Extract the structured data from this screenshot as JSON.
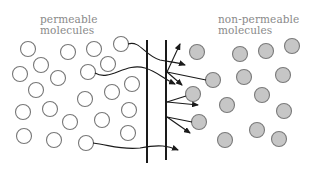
{
  "labels": {
    "left_line1": "permeable",
    "left_line2": "molecules",
    "right_line1": "non-permeable",
    "right_line2": "molecules"
  },
  "colors": {
    "permeable_fill": "#ffffff",
    "permeable_stroke": "#777777",
    "nonpermeable_fill": "#c6c6c6",
    "nonpermeable_stroke": "#7a7a7a",
    "membrane": "#1a1a1a",
    "label_text": "#8a8a8a"
  },
  "diagram": {
    "type": "membrane permeability",
    "permeable_molecule_count": 24,
    "nonpermeable_molecule_count": 16,
    "crossing_paths": 4,
    "bounce_arrows": 6
  }
}
